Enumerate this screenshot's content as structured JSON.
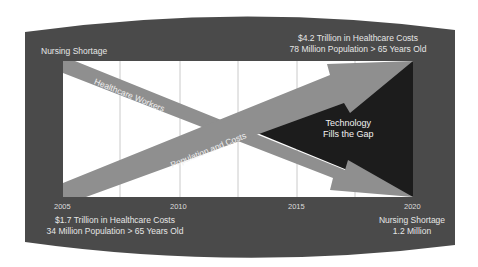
{
  "diagram": {
    "title_left": "Nursing Shortage",
    "top_right": {
      "line1": "$4.2 Trillion in Healthcare Costs",
      "line2": "78 Million Population > 65 Years Old"
    },
    "bottom_left": {
      "line1": "$1.7 Trillion in Healthcare Costs",
      "line2": "34 Million Population > 65 Years Old"
    },
    "bottom_right": {
      "line1": "Nursing Shortage",
      "line2": "1.2 Million"
    },
    "years": [
      "2005",
      "2010",
      "2015",
      "2020"
    ],
    "arrows": {
      "healthcare_workers": "Healthcare Workers",
      "population_costs": "Population and Costs"
    },
    "gap_label": {
      "line1": "Technology",
      "line2": "Fills the Gap"
    },
    "colors": {
      "frame": "#4a4a4a",
      "chart_bg": "#ffffff",
      "arrow": "#8f8f8f",
      "gap": "#1c1c1c",
      "gridline": "#bdbdbd",
      "text": "#e6e6e6"
    }
  }
}
